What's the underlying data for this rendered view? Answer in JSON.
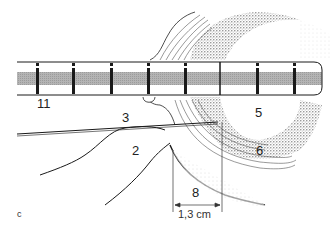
{
  "figure": {
    "panel_letter": "c",
    "labels": {
      "tube": "11",
      "probe": "3",
      "tissue_left": "2",
      "lumen": "5",
      "wall": "6",
      "distance": "8"
    },
    "measurement": "1,3 cm"
  },
  "colors": {
    "ink": "#1a1a1a",
    "stipple": "#9a9a9a",
    "tube_band": "#a8a8a8",
    "background": "#ffffff"
  }
}
